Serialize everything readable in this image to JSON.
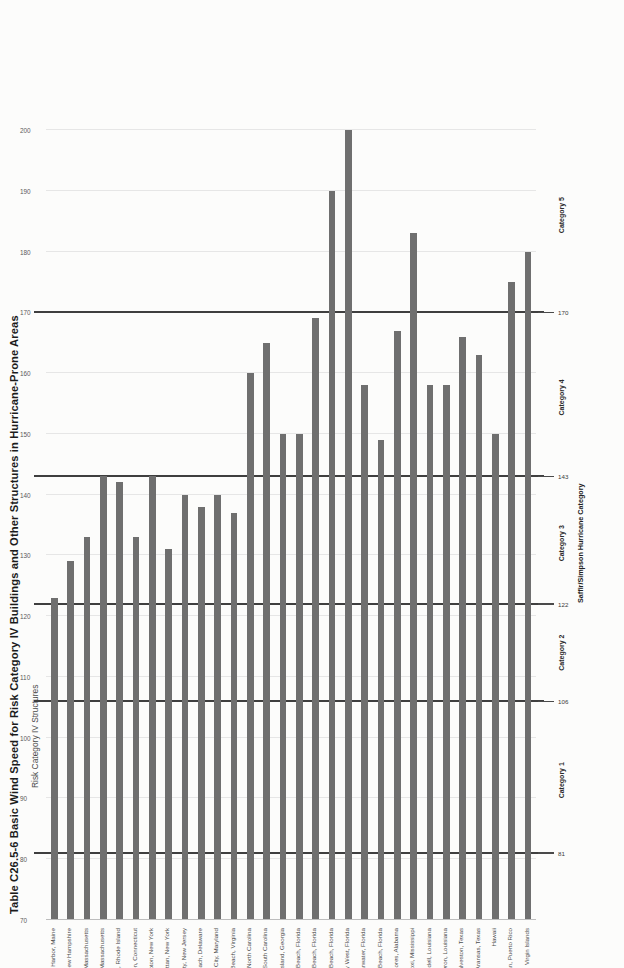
{
  "title": "Table C26.5-6 Basic Wind Speed for Risk Category IV Buildings and Other Structures in Hurricane-Prone Areas",
  "subtitle": "Risk Category IV Structures",
  "right_axis": {
    "title": "Saffir/Simpson Hurricane Category",
    "bands": [
      {
        "label": "Category 1",
        "value": 93
      },
      {
        "label": "Category 2",
        "value": 114
      },
      {
        "label": "Category 3",
        "value": 132
      },
      {
        "label": "Category 4",
        "value": 156
      },
      {
        "label": "Category 5",
        "value": 186
      }
    ],
    "reference_values": [
      "81",
      "106",
      "122",
      "143",
      "170"
    ]
  },
  "chart_data": {
    "type": "bar",
    "title": "Table C26.5-6 Basic Wind Speed for Risk Category IV Buildings and Other Structures in Hurricane-Prone Areas",
    "subtitle": "Risk Category IV Structures",
    "xlabel": "",
    "ylabel": "",
    "ylim": [
      70,
      200
    ],
    "yticks": [
      70,
      80,
      90,
      100,
      110,
      120,
      130,
      140,
      150,
      160,
      170,
      180,
      190,
      200
    ],
    "grid": true,
    "legend": "none",
    "reference_lines": [
      {
        "value": 81,
        "label": "81"
      },
      {
        "value": 106,
        "label": "106"
      },
      {
        "value": 122,
        "label": "122"
      },
      {
        "value": 143,
        "label": "143"
      },
      {
        "value": 170,
        "label": "170"
      }
    ],
    "categories": [
      "Bar Harbor, Maine",
      "Hampton Beach, New Hampshire",
      "Boston, Massachusetts",
      "Hyannis, Massachusetts",
      "Newport, Rhode Island",
      "New Haven, Connecticut",
      "Southhampton, New York",
      "Manhattan, New York",
      "Atlantic City, New Jersey",
      "Rehoboth Beach, Delaware",
      "Ocean City, Maryland",
      "Virginia Beach, Virginia",
      "Wrightsville Beach, North Carolina",
      "Folly Beach, South Carolina",
      "Sea Island, Georgia",
      "Jacksonville Beach, Florida",
      "Melbourne Beach, Florida",
      "Miami Beach, Florida",
      "Key West, Florida",
      "Clearwater, Florida",
      "Panama City Beach, Florida",
      "Gulf Shores, Alabama",
      "Biloxi, Mississippi",
      "Slidell, Louisiana",
      "Cameron, Louisiana",
      "Galveston, Texas",
      "Port Aransas, Texas",
      "Hawaii",
      "San Juan, Puerto Rico",
      "Virgin Islands"
    ],
    "values": [
      123,
      129,
      133,
      143,
      142,
      133,
      143,
      131,
      140,
      138,
      140,
      137,
      160,
      165,
      150,
      150,
      169,
      190,
      200,
      158,
      149,
      167,
      183,
      158,
      158,
      166,
      163,
      150,
      175,
      180
    ]
  }
}
